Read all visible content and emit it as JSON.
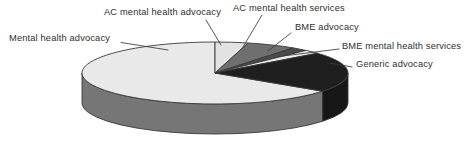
{
  "chart_data": {
    "type": "pie",
    "title": "",
    "subtitle": "",
    "xlabel": "",
    "ylabel": "",
    "legend_position": "callout-labels",
    "grid": false,
    "three_d": true,
    "start_angle_deg": 0,
    "direction": "clockwise",
    "categories": [
      "AC mental health advocacy",
      "AC mental health services",
      "BME advocacy",
      "BME mental health services",
      "Generic advocacy",
      "Mental health advocacy"
    ],
    "values": [
      4,
      6,
      2,
      2,
      21,
      65
    ],
    "unit": "percent",
    "slices": [
      {
        "label": "AC mental health advocacy",
        "value": 4,
        "color": "#e2e2e2",
        "side_color": "#9a9a9a"
      },
      {
        "label": "AC mental health services",
        "value": 6,
        "color": "#6f6f6f",
        "side_color": "#5a5a5a"
      },
      {
        "label": "BME advocacy",
        "value": 2,
        "color": "#4a4a4a",
        "side_color": "#3c3c3c"
      },
      {
        "label": "BME mental health services",
        "value": 2,
        "color": "#ededed",
        "side_color": "#a5a5a5"
      },
      {
        "label": "Generic advocacy",
        "value": 21,
        "color": "#1f1f1f",
        "side_color": "#171717"
      },
      {
        "label": "Mental health advocacy",
        "value": 65,
        "color": "#e9e9e9",
        "side_color": "#767676"
      }
    ],
    "colors": {
      "light": "#e9e9e9",
      "medium_gray": "#6f6f6f",
      "dark_gray": "#4a4a4a",
      "black": "#1f1f1f",
      "side_depth": "#767676",
      "outline": "#3a3a3a",
      "text": "#2f2f2f",
      "background": "#ffffff"
    }
  },
  "labels": {
    "ac_mental_health_advocacy": "AC mental health advocacy",
    "ac_mental_health_services": "AC mental health services",
    "bme_advocacy": "BME advocacy",
    "bme_mental_health_services": "BME mental health services",
    "generic_advocacy": "Generic advocacy",
    "mental_health_advocacy": "Mental health advocacy"
  }
}
